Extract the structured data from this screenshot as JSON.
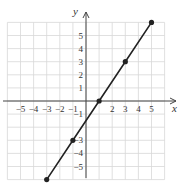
{
  "chart_data": {
    "type": "line",
    "title": "",
    "xlabel": "x",
    "ylabel": "y",
    "xlim": [
      -6,
      6
    ],
    "ylim": [
      -6,
      6
    ],
    "grid": true,
    "x_ticks": [
      -5,
      -4,
      -3,
      -2,
      -1,
      2,
      3,
      4,
      5
    ],
    "y_ticks": [
      5,
      4,
      3,
      2,
      1,
      -1,
      -3,
      -4,
      -5
    ],
    "series": [
      {
        "name": "line",
        "x": [
          -3,
          -1,
          1,
          3,
          5
        ],
        "y": [
          -6,
          -3,
          0,
          3,
          6
        ],
        "markers": true,
        "color": "#222222"
      }
    ],
    "equation": "y = 1.5x - 1.5"
  },
  "style": {
    "grid_color": "#d8d8d8",
    "axis_color": "#444444",
    "line_color": "#222222"
  }
}
